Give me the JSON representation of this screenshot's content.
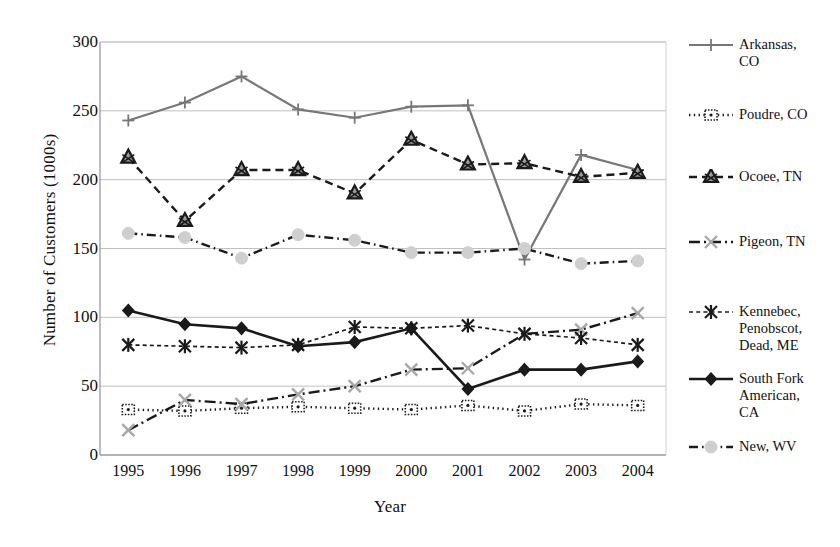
{
  "chart_data": {
    "type": "line",
    "title": "",
    "xlabel": "Year",
    "ylabel": "Number of Customers (1000s)",
    "categories": [
      "1995",
      "1996",
      "1997",
      "1998",
      "1999",
      "2000",
      "2001",
      "2002",
      "2003",
      "2004"
    ],
    "x": [
      1995,
      1996,
      1997,
      1998,
      1999,
      2000,
      2001,
      2002,
      2003,
      2004
    ],
    "ylim": [
      0,
      300
    ],
    "yticks": [
      0,
      50,
      100,
      150,
      200,
      250,
      300
    ],
    "grid": "horizontal",
    "legend_position": "right",
    "series": [
      {
        "name": "Arkansas, CO",
        "label": "Arkansas,\nCO",
        "color": "#777777",
        "marker": "plus",
        "dash": "solid",
        "values": [
          243,
          256,
          275,
          251,
          245,
          253,
          254,
          142,
          218,
          207
        ]
      },
      {
        "name": "Poudre, CO",
        "label": "Poudre, CO",
        "color": "#1a1a1a",
        "marker": "square-open",
        "dash": "dotted",
        "values": [
          33,
          32,
          34,
          35,
          34,
          33,
          36,
          32,
          37,
          36
        ]
      },
      {
        "name": "Ocoee, TN",
        "label": "Ocoee, TN",
        "color": "#1a1a1a",
        "marker": "triangle",
        "dash": "dashed",
        "values": [
          216,
          170,
          207,
          207,
          190,
          229,
          211,
          212,
          202,
          205
        ]
      },
      {
        "name": "Pigeon, TN",
        "label": "Pigeon, TN",
        "color": "#1a1a1a",
        "marker": "x-gray",
        "dash": "dashdot",
        "values": [
          18,
          40,
          37,
          44,
          50,
          62,
          63,
          88,
          91,
          103
        ]
      },
      {
        "name": "Kennebec, Penobscot, Dead, ME",
        "label": "Kennebec,\nPenobscot,\nDead, ME",
        "color": "#1a1a1a",
        "marker": "asterisk",
        "dash": "dashed-fine",
        "values": [
          80,
          79,
          78,
          80,
          93,
          92,
          94,
          88,
          85,
          80
        ]
      },
      {
        "name": "South Fork American, CA",
        "label": "South Fork\nAmerican,\nCA",
        "color": "#1a1a1a",
        "marker": "diamond",
        "dash": "solid-thick",
        "values": [
          105,
          95,
          92,
          79,
          82,
          92,
          48,
          62,
          62,
          68
        ]
      },
      {
        "name": "New, WV",
        "label": "New, WV",
        "color": "#1a1a1a",
        "marker": "circle-gray",
        "dash": "dashdot-long",
        "values": [
          161,
          158,
          143,
          160,
          156,
          147,
          147,
          150,
          139,
          141
        ]
      }
    ]
  }
}
